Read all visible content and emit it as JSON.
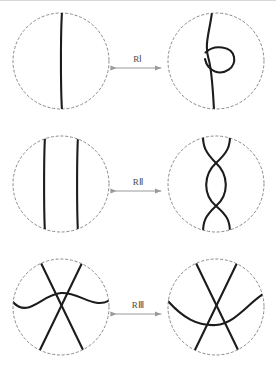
{
  "figure": {
    "background_color": "#ffffff",
    "top_rule_color": "#d8d8d8",
    "strand_color": "#1c1c1c",
    "circle_color": "#8a8a8a",
    "arrow_color": "#9a9a9a",
    "label_color": "#4a4a4a",
    "strand_width": 2.1,
    "circle_style": "dashed",
    "circle_radius": 48
  },
  "rows": [
    {
      "id": "row-r1",
      "label": "RⅠ",
      "label_plain": "RI",
      "arrow": "double-headed-horizontal",
      "left": {
        "name": "unknotted-strand-disk",
        "description": "single vertical strand through disk",
        "center": {
          "x": 61,
          "y": 61
        },
        "strands": 1
      },
      "right": {
        "name": "kinked-strand-disk",
        "description": "single strand with one loop (kink) on the right",
        "center": {
          "x": 216,
          "y": 61
        },
        "strands": 1,
        "crossings": 1
      }
    },
    {
      "id": "row-r2",
      "label": "RⅡ",
      "label_plain": "RII",
      "arrow": "double-headed-horizontal",
      "left": {
        "name": "parallel-strands-disk",
        "description": "two parallel vertical strands through disk",
        "center": {
          "x": 61,
          "y": 184
        },
        "strands": 2
      },
      "right": {
        "name": "double-crossed-strands-disk",
        "description": "two strands crossing twice forming a lens",
        "center": {
          "x": 216,
          "y": 184
        },
        "strands": 2,
        "crossings": 2
      }
    },
    {
      "id": "row-r3",
      "label": "RⅢ",
      "label_plain": "RIII",
      "arrow": "double-headed-horizontal",
      "left": {
        "name": "triple-strand-over-disk",
        "description": "two diagonal strands crossed with a third strand passing above the crossing",
        "center": {
          "x": 61,
          "y": 307
        },
        "strands": 3,
        "crossings": 3
      },
      "right": {
        "name": "triple-strand-under-disk",
        "description": "two diagonal strands crossed with a third strand passing below the crossing",
        "center": {
          "x": 216,
          "y": 307
        },
        "strands": 3,
        "crossings": 3
      }
    }
  ],
  "arrows": [
    {
      "name": "arrow-r1",
      "x1": 116,
      "x2": 161,
      "y": 68
    },
    {
      "name": "arrow-r2",
      "x1": 116,
      "x2": 161,
      "y": 191
    },
    {
      "name": "arrow-r3",
      "x1": 116,
      "x2": 161,
      "y": 314
    }
  ],
  "labels": [
    {
      "name": "label-r1",
      "x": 138,
      "y": 62
    },
    {
      "name": "label-r2",
      "x": 138,
      "y": 185
    },
    {
      "name": "label-r3",
      "x": 138,
      "y": 308
    }
  ]
}
